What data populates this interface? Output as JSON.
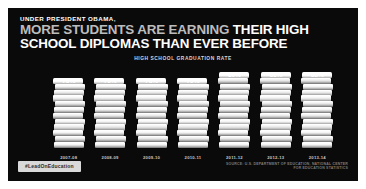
{
  "poster": {
    "kicker": "UNDER PRESIDENT OBAMA,",
    "headline_line1_grey": "MORE STUDENTS ARE EARNING ",
    "headline_line1_white": "THEIR HIGH",
    "headline_line2": "SCHOOL DIPLOMAS THAN EVER BEFORE",
    "hashtag": "#LeadOnEducation",
    "source": "SOURCE: U.S. DEPARTMENT OF EDUCATION, NATIONAL CENTER FOR EDUCATION STATISTICS",
    "background_color": "#0a0a0a",
    "accent_color": "#ffffff"
  },
  "chart_data": {
    "type": "bar",
    "title": "HIGH SCHOOL GRADUATION RATE",
    "xlabel": "",
    "ylabel": "",
    "ylim": [
      0,
      85
    ],
    "grid": false,
    "legend": "none",
    "categories": [
      "2007-08",
      "2008-09",
      "2009-10",
      "2010-11",
      "2011-12",
      "2012-13",
      "2013-14"
    ],
    "values": [
      75,
      75,
      78,
      79,
      80,
      81,
      82
    ],
    "value_labels": [
      "75%",
      "75%",
      "78%",
      "79%",
      "80%",
      "81%",
      "82%"
    ],
    "bar_style": "stacked-books"
  }
}
